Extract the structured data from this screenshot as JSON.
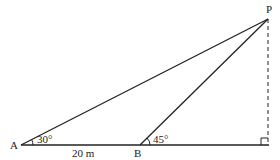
{
  "diagram": {
    "points": {
      "A": "A",
      "B": "B",
      "P": "P"
    },
    "angles": {
      "at_A": "30°",
      "at_B": "45°"
    },
    "lengths": {
      "AB": "20 m"
    },
    "colors": {
      "stroke": "#222222"
    }
  }
}
